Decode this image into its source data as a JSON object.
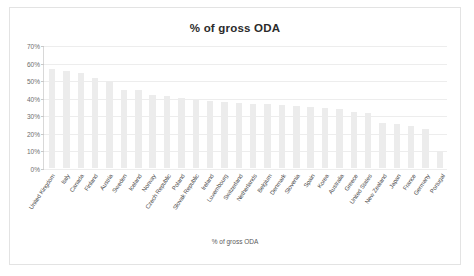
{
  "chart_data": {
    "type": "bar",
    "title": "% of gross ODA",
    "xlabel": "% of gross ODA",
    "ylabel": "",
    "ylim": [
      0,
      70
    ],
    "ytick_labels": [
      "70%",
      "60%",
      "50%",
      "40%",
      "30%",
      "20%",
      "10%",
      "0%"
    ],
    "ytick_values": [
      70,
      60,
      50,
      40,
      30,
      20,
      10,
      0
    ],
    "grid": true,
    "legend": "none",
    "bar_color": "#ececec",
    "categories": [
      "United Kingdom",
      "Italy",
      "Canada",
      "Finland",
      "Austria",
      "Sweden",
      "Iceland",
      "Norway",
      "Czech Republic",
      "Poland",
      "Slovak Republic",
      "Ireland",
      "Luxembourg",
      "Switzerland",
      "Netherlands",
      "Belgium",
      "Denmark",
      "Slovenia",
      "Spain",
      "Korea",
      "Australia",
      "Greece",
      "United States",
      "New Zealand",
      "Japan",
      "France",
      "Germany",
      "Portugal"
    ],
    "values": [
      57,
      55.5,
      54.5,
      51.5,
      50,
      45,
      44.5,
      42,
      41.5,
      40,
      39,
      38.5,
      38,
      37.5,
      37,
      36.5,
      36,
      35.5,
      35,
      34.5,
      34,
      32,
      31.5,
      26,
      25.5,
      24,
      22.5,
      10
    ]
  },
  "axis": {
    "ytick_0": "70%",
    "ytick_1": "60%",
    "ytick_2": "50%",
    "ytick_3": "40%",
    "ytick_4": "30%",
    "ytick_5": "20%",
    "ytick_6": "10%",
    "ytick_7": "0%"
  }
}
